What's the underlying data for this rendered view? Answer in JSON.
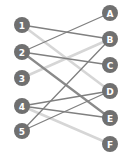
{
  "diagram": {
    "type": "bipartite-matching",
    "node_color": "#707070",
    "label_color": "#ffffff",
    "left_nodes": [
      {
        "id": "1",
        "label": "1",
        "x": 22,
        "y": 25
      },
      {
        "id": "2",
        "label": "2",
        "x": 22,
        "y": 52
      },
      {
        "id": "3",
        "label": "3",
        "x": 22,
        "y": 78
      },
      {
        "id": "4",
        "label": "4",
        "x": 22,
        "y": 106
      },
      {
        "id": "5",
        "label": "5",
        "x": 22,
        "y": 131
      }
    ],
    "right_nodes": [
      {
        "id": "A",
        "label": "A",
        "x": 110,
        "y": 13
      },
      {
        "id": "B",
        "label": "B",
        "x": 110,
        "y": 39
      },
      {
        "id": "C",
        "label": "C",
        "x": 110,
        "y": 65
      },
      {
        "id": "D",
        "label": "D",
        "x": 110,
        "y": 91
      },
      {
        "id": "E",
        "label": "E",
        "x": 110,
        "y": 118
      },
      {
        "id": "F",
        "label": "F",
        "x": 110,
        "y": 144
      }
    ],
    "edges": [
      {
        "from": "1",
        "to": "B",
        "style": "dark",
        "color": "#808080",
        "width": 1.3
      },
      {
        "from": "1",
        "to": "D",
        "style": "light",
        "color": "#d6d6d6",
        "width": 2.5
      },
      {
        "from": "2",
        "to": "A",
        "style": "dark",
        "color": "#808080",
        "width": 1.3
      },
      {
        "from": "2",
        "to": "C",
        "style": "dark",
        "color": "#808080",
        "width": 1.3
      },
      {
        "from": "2",
        "to": "E",
        "style": "thick",
        "color": "#8a8a8a",
        "width": 2.2
      },
      {
        "from": "3",
        "to": "B",
        "style": "light",
        "color": "#d6d6d6",
        "width": 2.5
      },
      {
        "from": "4",
        "to": "D",
        "style": "dark",
        "color": "#808080",
        "width": 1.3
      },
      {
        "from": "4",
        "to": "E",
        "style": "dark",
        "color": "#808080",
        "width": 1.3
      },
      {
        "from": "4",
        "to": "F",
        "style": "light",
        "color": "#d6d6d6",
        "width": 2.5
      },
      {
        "from": "5",
        "to": "B",
        "style": "dark",
        "color": "#808080",
        "width": 1.3
      },
      {
        "from": "5",
        "to": "D",
        "style": "dark",
        "color": "#808080",
        "width": 1.3
      }
    ]
  }
}
